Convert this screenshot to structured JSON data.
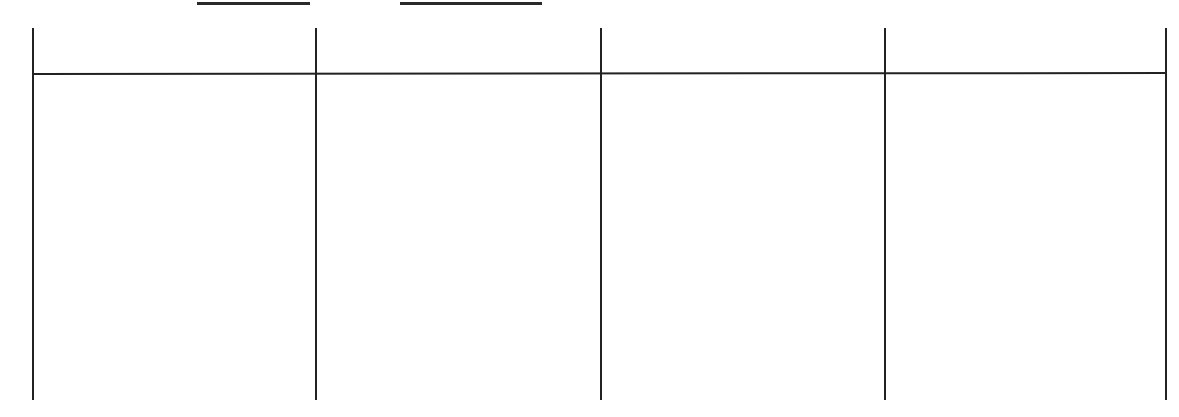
{
  "worksheet": {
    "header_fields": [
      {
        "label": "",
        "value": ""
      },
      {
        "label": "",
        "value": ""
      }
    ],
    "table": {
      "columns": 4,
      "headers": [
        "",
        "",
        "",
        ""
      ],
      "rows": [
        [
          "",
          "",
          "",
          ""
        ]
      ]
    }
  }
}
